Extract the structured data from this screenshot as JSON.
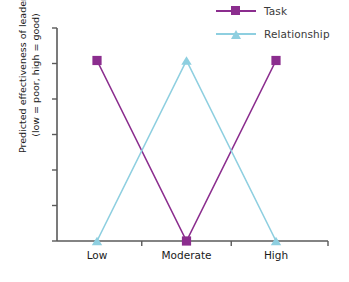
{
  "chart_data": {
    "type": "line",
    "title": "",
    "subtitle": "",
    "xlabel": "",
    "ylabel": "Predicted effectiveness of leader (low = poor, high = good)",
    "ylabel_lines": [
      "Predicted effectiveness of leader",
      "(low = poor, high = good)"
    ],
    "categories": [
      "Low",
      "Moderate",
      "High"
    ],
    "series": [
      {
        "name": "Task",
        "values": [
          1,
          0,
          1
        ],
        "color": "#8B2D8E",
        "marker": "square"
      },
      {
        "name": "Relationship",
        "values": [
          0,
          1,
          0
        ],
        "color": "#8ECFE0",
        "marker": "triangle"
      }
    ],
    "ylim": [
      0,
      1.18
    ],
    "y_tick_count": 6,
    "y_tick_labels": [],
    "grid": false,
    "legend_position": "top-right",
    "axis_color": "#5a5a5a",
    "annotations": []
  },
  "legend": {
    "entries": [
      {
        "label": "Task",
        "color": "#8B2D8E",
        "marker": "square-marker"
      },
      {
        "label": "Relationship",
        "color": "#8ECFE0",
        "marker": "triangle-marker"
      }
    ]
  },
  "axes": {
    "x_tick_labels": [
      "Low",
      "Moderate",
      "High"
    ],
    "y_axis_label_line1": "Predicted effectiveness of leader",
    "y_axis_label_line2": "(low = poor, high = good)"
  }
}
